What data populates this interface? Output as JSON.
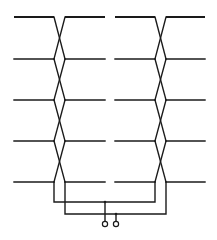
{
  "diagram": {
    "type": "transposed-conductor-schematic",
    "line_color": "#1a1a1a",
    "background": "#ffffff",
    "rows_y": [
      17,
      59,
      100,
      141,
      182
    ],
    "blocks": [
      {
        "name": "left-block",
        "x_start": 14,
        "x_cross_left": 54,
        "x_cross_right": 65,
        "x_end": 105
      },
      {
        "name": "right-block",
        "x_start": 115,
        "x_cross_left": 155,
        "x_cross_right": 166,
        "x_end": 205
      }
    ],
    "buses": [
      {
        "name": "bus-a",
        "y": 202,
        "x_from": 54,
        "x_to": 155
      },
      {
        "name": "bus-b",
        "y": 214,
        "x_from": 65,
        "x_to": 166
      }
    ],
    "terminals": [
      {
        "name": "terminal-a",
        "x": 105,
        "bus_y": 202,
        "circle_y": 224,
        "r": 2.6
      },
      {
        "name": "terminal-b",
        "x": 116,
        "bus_y": 214,
        "circle_y": 224,
        "r": 2.6
      }
    ]
  }
}
